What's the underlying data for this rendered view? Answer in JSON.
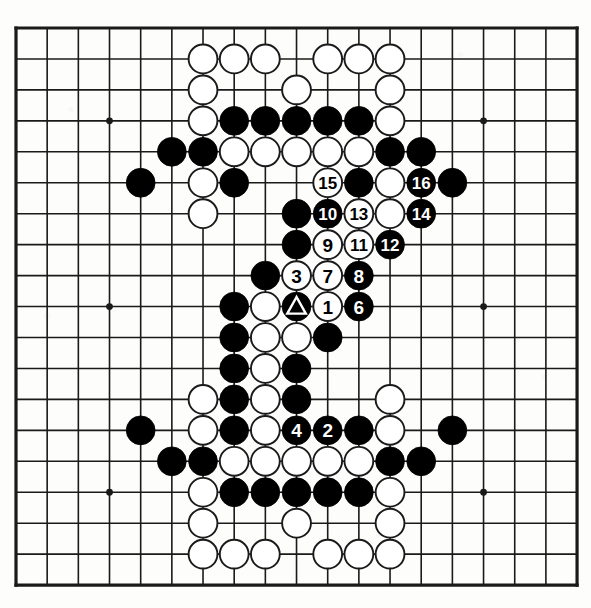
{
  "diagram": {
    "type": "go-board-diagram",
    "board_size": 19,
    "colors": {
      "line": "#1a1a1a",
      "black_stone": "#000000",
      "white_stone": "#ffffff",
      "white_stone_border": "#1a1a1a",
      "background": "#fdfdfb",
      "black_label_text": "#ffffff",
      "white_label_text": "#000000"
    },
    "geometry": {
      "left": 16,
      "top": 28,
      "step_x": 31.17,
      "step_y": 30.95,
      "stone_radius": 14.4,
      "border_width": 3.2,
      "grid_width": 1.6
    },
    "star_points": [
      {
        "col": 3,
        "row": 3
      },
      {
        "col": 15,
        "row": 3
      },
      {
        "col": 3,
        "row": 9
      },
      {
        "col": 15,
        "row": 9
      },
      {
        "col": 3,
        "row": 15
      },
      {
        "col": 15,
        "row": 15
      }
    ],
    "stones": [
      {
        "col": 6,
        "row": 1,
        "color": "white"
      },
      {
        "col": 7,
        "row": 1,
        "color": "white"
      },
      {
        "col": 8,
        "row": 1,
        "color": "white"
      },
      {
        "col": 10,
        "row": 1,
        "color": "white"
      },
      {
        "col": 11,
        "row": 1,
        "color": "white"
      },
      {
        "col": 12,
        "row": 1,
        "color": "white"
      },
      {
        "col": 6,
        "row": 2,
        "color": "white"
      },
      {
        "col": 9,
        "row": 2,
        "color": "white"
      },
      {
        "col": 12,
        "row": 2,
        "color": "white"
      },
      {
        "col": 6,
        "row": 3,
        "color": "white"
      },
      {
        "col": 7,
        "row": 3,
        "color": "black"
      },
      {
        "col": 8,
        "row": 3,
        "color": "black"
      },
      {
        "col": 9,
        "row": 3,
        "color": "black"
      },
      {
        "col": 10,
        "row": 3,
        "color": "black"
      },
      {
        "col": 11,
        "row": 3,
        "color": "black"
      },
      {
        "col": 12,
        "row": 3,
        "color": "white"
      },
      {
        "col": 5,
        "row": 4,
        "color": "black"
      },
      {
        "col": 6,
        "row": 4,
        "color": "black"
      },
      {
        "col": 7,
        "row": 4,
        "color": "white"
      },
      {
        "col": 8,
        "row": 4,
        "color": "white"
      },
      {
        "col": 9,
        "row": 4,
        "color": "white"
      },
      {
        "col": 10,
        "row": 4,
        "color": "white"
      },
      {
        "col": 11,
        "row": 4,
        "color": "white"
      },
      {
        "col": 12,
        "row": 4,
        "color": "black"
      },
      {
        "col": 13,
        "row": 4,
        "color": "black"
      },
      {
        "col": 4,
        "row": 5,
        "color": "black"
      },
      {
        "col": 6,
        "row": 5,
        "color": "white"
      },
      {
        "col": 7,
        "row": 5,
        "color": "black"
      },
      {
        "col": 10,
        "row": 5,
        "color": "white",
        "label": "15"
      },
      {
        "col": 11,
        "row": 5,
        "color": "black"
      },
      {
        "col": 12,
        "row": 5,
        "color": "white"
      },
      {
        "col": 13,
        "row": 5,
        "color": "black",
        "label": "16"
      },
      {
        "col": 14,
        "row": 5,
        "color": "black"
      },
      {
        "col": 6,
        "row": 6,
        "color": "white"
      },
      {
        "col": 9,
        "row": 6,
        "color": "black"
      },
      {
        "col": 10,
        "row": 6,
        "color": "black",
        "label": "10"
      },
      {
        "col": 11,
        "row": 6,
        "color": "white",
        "label": "13"
      },
      {
        "col": 12,
        "row": 6,
        "color": "white"
      },
      {
        "col": 13,
        "row": 6,
        "color": "black",
        "label": "14"
      },
      {
        "col": 9,
        "row": 7,
        "color": "black"
      },
      {
        "col": 10,
        "row": 7,
        "color": "white",
        "label": "9"
      },
      {
        "col": 11,
        "row": 7,
        "color": "white",
        "label": "11"
      },
      {
        "col": 12,
        "row": 7,
        "color": "black",
        "label": "12"
      },
      {
        "col": 8,
        "row": 8,
        "color": "black"
      },
      {
        "col": 9,
        "row": 8,
        "color": "white",
        "label": "3"
      },
      {
        "col": 10,
        "row": 8,
        "color": "white",
        "label": "7"
      },
      {
        "col": 11,
        "row": 8,
        "color": "black",
        "label": "8"
      },
      {
        "col": 7,
        "row": 9,
        "color": "black"
      },
      {
        "col": 8,
        "row": 9,
        "color": "white"
      },
      {
        "col": 9,
        "row": 9,
        "color": "black",
        "marker": "triangle"
      },
      {
        "col": 10,
        "row": 9,
        "color": "white",
        "label": "1"
      },
      {
        "col": 11,
        "row": 9,
        "color": "black",
        "label": "6"
      },
      {
        "col": 7,
        "row": 10,
        "color": "black"
      },
      {
        "col": 8,
        "row": 10,
        "color": "white"
      },
      {
        "col": 9,
        "row": 10,
        "color": "white"
      },
      {
        "col": 10,
        "row": 10,
        "color": "black"
      },
      {
        "col": 7,
        "row": 11,
        "color": "black"
      },
      {
        "col": 8,
        "row": 11,
        "color": "white"
      },
      {
        "col": 9,
        "row": 11,
        "color": "black"
      },
      {
        "col": 6,
        "row": 12,
        "color": "white"
      },
      {
        "col": 7,
        "row": 12,
        "color": "black"
      },
      {
        "col": 8,
        "row": 12,
        "color": "white"
      },
      {
        "col": 9,
        "row": 12,
        "color": "black"
      },
      {
        "col": 12,
        "row": 12,
        "color": "white"
      },
      {
        "col": 4,
        "row": 13,
        "color": "black"
      },
      {
        "col": 6,
        "row": 13,
        "color": "white"
      },
      {
        "col": 7,
        "row": 13,
        "color": "black"
      },
      {
        "col": 8,
        "row": 13,
        "color": "white"
      },
      {
        "col": 9,
        "row": 13,
        "color": "black",
        "label": "4"
      },
      {
        "col": 10,
        "row": 13,
        "color": "black",
        "label": "2"
      },
      {
        "col": 11,
        "row": 13,
        "color": "black"
      },
      {
        "col": 12,
        "row": 13,
        "color": "white"
      },
      {
        "col": 14,
        "row": 13,
        "color": "black"
      },
      {
        "col": 5,
        "row": 14,
        "color": "black"
      },
      {
        "col": 6,
        "row": 14,
        "color": "black"
      },
      {
        "col": 7,
        "row": 14,
        "color": "white"
      },
      {
        "col": 8,
        "row": 14,
        "color": "white"
      },
      {
        "col": 9,
        "row": 14,
        "color": "white"
      },
      {
        "col": 10,
        "row": 14,
        "color": "white"
      },
      {
        "col": 11,
        "row": 14,
        "color": "white"
      },
      {
        "col": 12,
        "row": 14,
        "color": "black"
      },
      {
        "col": 13,
        "row": 14,
        "color": "black"
      },
      {
        "col": 6,
        "row": 15,
        "color": "white"
      },
      {
        "col": 7,
        "row": 15,
        "color": "black"
      },
      {
        "col": 8,
        "row": 15,
        "color": "black"
      },
      {
        "col": 9,
        "row": 15,
        "color": "black"
      },
      {
        "col": 10,
        "row": 15,
        "color": "black"
      },
      {
        "col": 11,
        "row": 15,
        "color": "black"
      },
      {
        "col": 12,
        "row": 15,
        "color": "white"
      },
      {
        "col": 6,
        "row": 16,
        "color": "white"
      },
      {
        "col": 9,
        "row": 16,
        "color": "white"
      },
      {
        "col": 12,
        "row": 16,
        "color": "white"
      },
      {
        "col": 6,
        "row": 17,
        "color": "white"
      },
      {
        "col": 7,
        "row": 17,
        "color": "white"
      },
      {
        "col": 8,
        "row": 17,
        "color": "white"
      },
      {
        "col": 10,
        "row": 17,
        "color": "white"
      },
      {
        "col": 11,
        "row": 17,
        "color": "white"
      },
      {
        "col": 12,
        "row": 17,
        "color": "white"
      }
    ],
    "move_sequence": [
      "1",
      "2",
      "3",
      "4",
      "6",
      "7",
      "8",
      "9",
      "10",
      "11",
      "12",
      "13",
      "14",
      "15",
      "16"
    ],
    "markers": [
      "triangle"
    ]
  }
}
